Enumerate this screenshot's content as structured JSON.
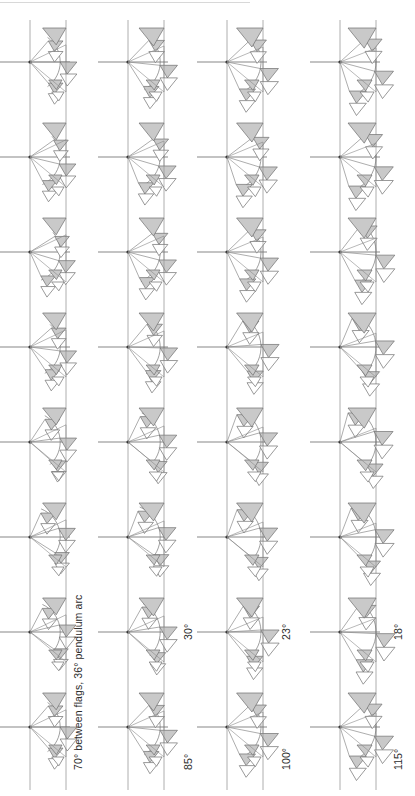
{
  "page": {
    "width": 415,
    "height": 796,
    "background": "#ffffff"
  },
  "style": {
    "flag_fill": "#c9c9c9",
    "flag_stroke": "#6e6e6e",
    "outline_stroke": "#8a8a8a",
    "rail_stroke": "#9a9a9a",
    "axis_stroke": "#555555",
    "arc_stroke": "#777777",
    "text_color": "#2b2b2b"
  },
  "columns": [
    {
      "id": "column-1",
      "label": "70° between flags, 36° pendulum arc",
      "angle_between_flags": 70,
      "pendulum_arc": 36,
      "label_kind": "full",
      "x": 30,
      "strip_width": 36,
      "figure_count": 8,
      "spread": 0.42
    },
    {
      "id": "column-2",
      "label": "85°",
      "secondary_label": "30°",
      "angle_between_flags": 85,
      "pendulum_arc": 30,
      "label_kind": "short",
      "x": 128,
      "strip_width": 36,
      "figure_count": 8,
      "spread": 0.62
    },
    {
      "id": "column-3",
      "label": "100°",
      "secondary_label": "23°",
      "angle_between_flags": 100,
      "pendulum_arc": 23,
      "label_kind": "short",
      "x": 227,
      "strip_width": 36,
      "figure_count": 8,
      "spread": 0.8
    },
    {
      "id": "column-4",
      "label": "115°",
      "secondary_label": "18°",
      "angle_between_flags": 115,
      "pendulum_arc": 18,
      "label_kind": "short",
      "x": 340,
      "strip_width": 36,
      "figure_count": 8,
      "spread": 1.0
    }
  ],
  "labels": {
    "col1_primary": "70° between flags, 36° pendulum arc",
    "col2_primary": "85°",
    "col2_secondary": "30°",
    "col3_primary": "100°",
    "col3_secondary": "23°",
    "col4_primary": "115°",
    "col4_secondary": "18°"
  },
  "figure_sequence": {
    "description": "Eight stacked pendulum-flag figures per column, pitch 95 px",
    "pitch": 95,
    "first_center_y": 62,
    "flags_per_figure": 3,
    "phases": [
      0,
      1,
      2,
      3,
      4,
      5,
      6,
      7
    ]
  }
}
